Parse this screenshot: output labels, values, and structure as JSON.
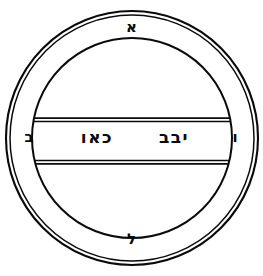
{
  "figure": {
    "ink_color": "#0a0a0a",
    "background_color": "#ffffff"
  },
  "ring_letters": {
    "top": "א",
    "bottom": "ל",
    "left": "ב",
    "right": "ו"
  },
  "band_text": {
    "right_word": "יבב",
    "left_word": "כאו",
    "full_line": "יבב כאו"
  },
  "geometry": {
    "center_x": 132,
    "center_y": 138,
    "outer_ring_outer_radius": 127,
    "outer_ring_inner_radius": 123,
    "inner_circle_radius": 100,
    "band_top_y": 118,
    "band_bottom_y": 163,
    "band_line_gap": 3,
    "stroke_width": 1.6
  }
}
